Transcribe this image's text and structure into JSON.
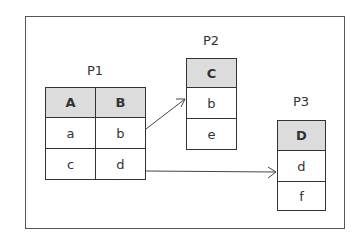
{
  "diagram": {
    "partitions": [
      {
        "name": "P1",
        "columns": [
          "A",
          "B"
        ],
        "rows": [
          [
            "a",
            "b"
          ],
          [
            "c",
            "d"
          ]
        ]
      },
      {
        "name": "P2",
        "columns": [
          "C"
        ],
        "rows": [
          [
            "b"
          ],
          [
            "e"
          ]
        ]
      },
      {
        "name": "P3",
        "columns": [
          "D"
        ],
        "rows": [
          [
            "d"
          ],
          [
            "f"
          ]
        ]
      }
    ],
    "links": [
      {
        "from": "P1.row1.B (b)",
        "to": "P2.row1 (b)"
      },
      {
        "from": "P1.row2.B (d)",
        "to": "P3.row1 (d)"
      }
    ],
    "colors": {
      "header_fill": "#dcdcdc",
      "border": "#333333",
      "background": "#ffffff"
    }
  }
}
